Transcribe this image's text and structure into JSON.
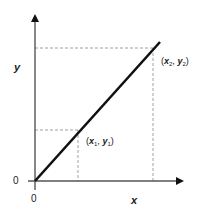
{
  "diagram": {
    "type": "linear-relationship",
    "axis_labels": {
      "x": "x",
      "y": "y"
    },
    "origin_labels": {
      "x_axis": "0",
      "y_axis": "0"
    },
    "points": [
      {
        "name": "point-1",
        "label_open": "(",
        "var_x": "x",
        "sub_x": "1",
        "sep": ", ",
        "var_y": "y",
        "sub_y": "1",
        "label_close": ")",
        "x_frac": 0.28,
        "y_frac": 0.37
      },
      {
        "name": "point-2",
        "label_open": "(",
        "var_x": "x",
        "sub_x": "2",
        "sep": ", ",
        "var_y": "y",
        "sub_y": "2",
        "label_close": ")",
        "x_frac": 0.78,
        "y_frac": 0.96
      }
    ],
    "colors": {
      "line": "#111111",
      "axis": "#555555",
      "dashed": "#888888"
    }
  }
}
